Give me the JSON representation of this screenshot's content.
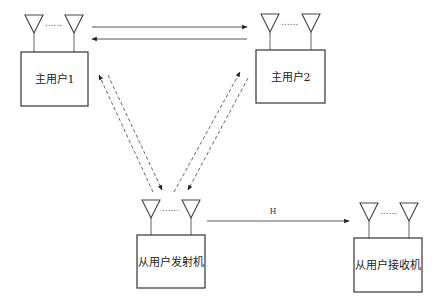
{
  "nodes": {
    "primary_user_1": {
      "label": "主用户1",
      "antennas": 2
    },
    "primary_user_2": {
      "label": "主用户2",
      "antennas": 2
    },
    "secondary_tx": {
      "label": "从用户发射机",
      "antennas": 2
    },
    "secondary_rx": {
      "label": "从用户接收机",
      "antennas": 2
    }
  },
  "antenna_ellipsis": "......",
  "links": [
    {
      "from": "primary_user_1",
      "to": "primary_user_2",
      "style": "solid"
    },
    {
      "from": "primary_user_2",
      "to": "primary_user_1",
      "style": "solid"
    },
    {
      "from": "secondary_tx",
      "to": "primary_user_1",
      "style": "dashed"
    },
    {
      "from": "primary_user_1",
      "to": "secondary_tx",
      "style": "dashed"
    },
    {
      "from": "secondary_tx",
      "to": "primary_user_2",
      "style": "dashed"
    },
    {
      "from": "primary_user_2",
      "to": "secondary_tx",
      "style": "dashed"
    },
    {
      "from": "secondary_tx",
      "to": "secondary_rx",
      "style": "solid",
      "label": "H"
    }
  ],
  "channel_label": "H"
}
